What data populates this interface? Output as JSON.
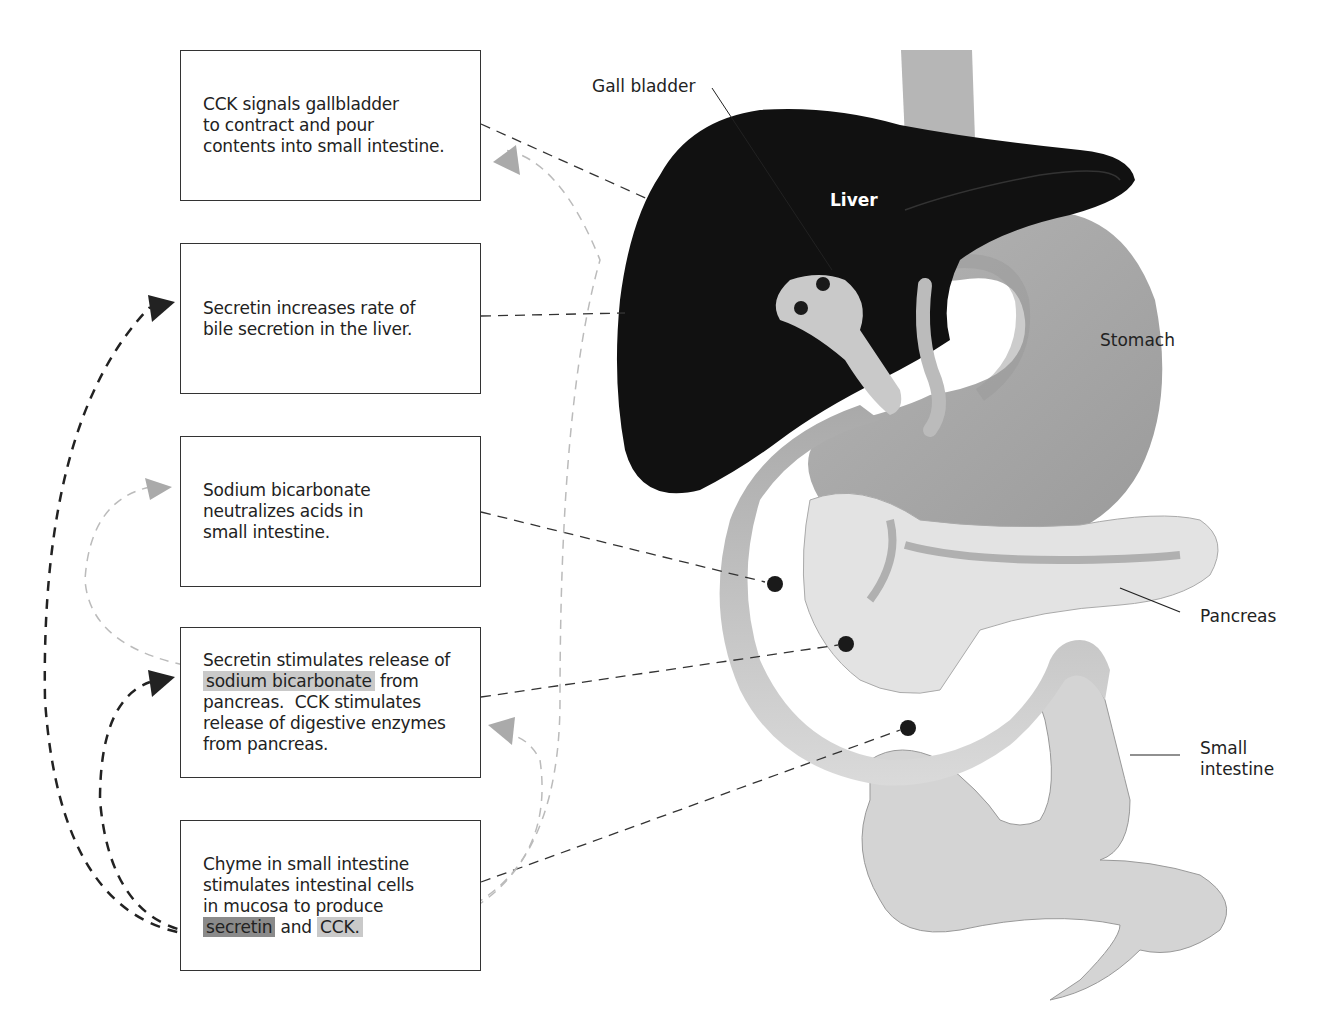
{
  "diagram": {
    "boxes": [
      {
        "id": "box-cck-gallbladder",
        "text": "CCK signals gallbladder to contract and pour contents into small intestine.",
        "lines": [
          "CCK signals gallbladder",
          "to contract and pour",
          "contents into small intestine."
        ]
      },
      {
        "id": "box-secretin-bile",
        "text": "Secretin increases rate of bile secretion in the liver.",
        "lines": [
          "Secretin increases rate of",
          "bile secretion in the liver."
        ]
      },
      {
        "id": "box-bicarbonate",
        "text": "Sodium bicarbonate neutralizes acids in small intestine.",
        "lines": [
          "Sodium bicarbonate",
          "neutralizes acids in",
          "small intestine."
        ]
      },
      {
        "id": "box-pancreas",
        "line1": "Secretin stimulates release of",
        "highlight": "sodium bicarbonate",
        "line2_rest": " from",
        "lines_after": [
          "pancreas.  CCK stimulates",
          "release of digestive enzymes",
          "from pancreas."
        ]
      },
      {
        "id": "box-chyme",
        "lines": [
          "Chyme in small intestine",
          "stimulates intestinal cells",
          "in mucosa to produce"
        ],
        "highlight_secretin": "secretin",
        "and": " and ",
        "highlight_cck": "CCK."
      }
    ],
    "organ_labels": {
      "gall_bladder": "Gall bladder",
      "liver": "Liver",
      "stomach": "Stomach",
      "pancreas": "Pancreas",
      "small_intestine_line1": "Small",
      "small_intestine_line2": "intestine"
    },
    "colors": {
      "liver": "#111111",
      "stomach": "#a8a8a8",
      "gallbladder": "#c8c8c8",
      "pancreas": "#e2e2e2",
      "intestine": "#bdbdbd",
      "secretin_arrow": "#222222",
      "cck_arrow": "#b0b0b0",
      "highlight_light": "#c9c9c9",
      "highlight_dark": "#8a8a8a"
    }
  }
}
